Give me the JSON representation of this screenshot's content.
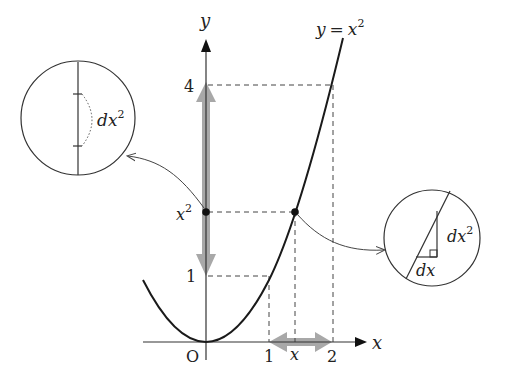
{
  "figure": {
    "curve_label": "y = x²",
    "curve_label_parts": {
      "y": "y",
      "eq": "=",
      "x": "x",
      "exp": "2"
    },
    "axes": {
      "x_label": "x",
      "y_label": "y",
      "origin_label": "O"
    },
    "x_ticks": [
      "1",
      "x",
      "2"
    ],
    "y_ticks": {
      "one": "1",
      "x2_base": "x",
      "x2_exp": "2",
      "four": "4"
    },
    "left_zoom": {
      "label_base": "dx",
      "label_exp": "2"
    },
    "right_zoom": {
      "rise_base": "dx",
      "rise_exp": "2",
      "run": "dx"
    },
    "colors": {
      "curve": "#1a1a1a",
      "axis": "#333333",
      "dashed": "#444444",
      "arrow_band": "#9a9a9a",
      "point": "#111111"
    }
  }
}
